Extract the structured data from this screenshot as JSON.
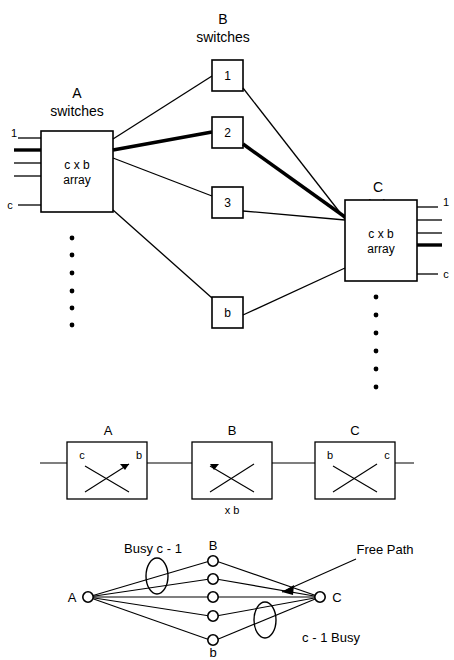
{
  "figure": {
    "background_color": "#ffffff",
    "line_color": "#000000"
  },
  "top_stage": {
    "stage_a": {
      "title_line1": "A",
      "title_line2": "switches",
      "box_line1": "c x b",
      "box_line2": "array",
      "input_top_label": "1",
      "input_bottom_label": "c",
      "input_count": 4,
      "bold_input_index": 2
    },
    "stage_b": {
      "title_line1": "B",
      "title_line2": "switches",
      "switch_labels": [
        "1",
        "2",
        "3",
        "b"
      ]
    },
    "stage_c": {
      "title_line1": "C",
      "title_line2": "switches",
      "box_line1": "c x b",
      "box_line2": "array",
      "output_top_label": "1",
      "output_bottom_label": "c",
      "output_count": 4,
      "bold_output_index": 4
    },
    "highlighted_path": "A -> 2 -> C",
    "vertical_ellipsis_dots": 6
  },
  "middle_stage": {
    "switches": [
      {
        "title": "A",
        "left_label": "c",
        "right_label": "b",
        "sub_label": ""
      },
      {
        "title": "B",
        "left_label": "",
        "right_label": "",
        "sub_label": "x b"
      },
      {
        "title": "C",
        "left_label": "b",
        "right_label": "c",
        "sub_label": ""
      }
    ]
  },
  "bottom_stage": {
    "node_a_label": "A",
    "node_c_label": "C",
    "column_top_label": "B",
    "column_bottom_label": "b",
    "annotation_left": "Busy  c - 1",
    "annotation_right": "c - 1   Busy",
    "annotation_arrow": "Free Path",
    "middle_node_count": 5
  }
}
